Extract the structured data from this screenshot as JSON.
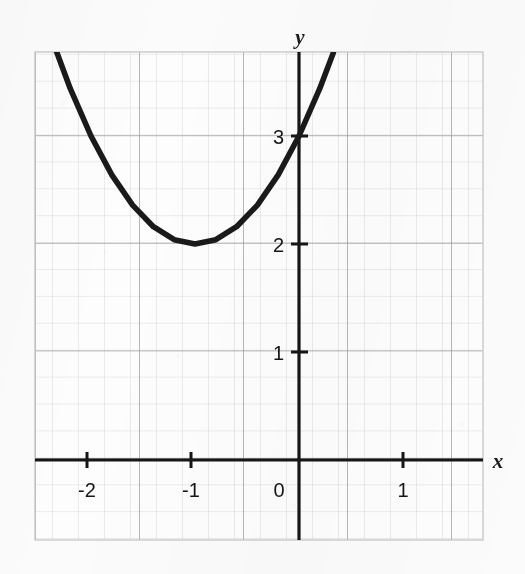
{
  "chart_data": {
    "type": "line",
    "title": "",
    "subtitle": "",
    "xlabel": "x",
    "ylabel": "y",
    "function": "y = (x + 1)^2 + 2",
    "curve_color": "#1a1a1a",
    "xlim": [
      -2.55,
      1.78
    ],
    "ylim": [
      -0.74,
      3.78
    ],
    "grid": true,
    "grid_minor_step": 0.25,
    "grid_major_step": 1,
    "legend": "none",
    "vertex": [
      -1,
      2
    ],
    "y_intercept": [
      0,
      3
    ],
    "x_tick_labels": [
      "-2",
      "-1",
      "0",
      "1"
    ],
    "x_tick_values": [
      -2,
      -1,
      0,
      1
    ],
    "y_tick_labels": [
      "1",
      "2",
      "3"
    ],
    "y_tick_values": [
      1,
      2,
      3
    ],
    "series": [
      {
        "name": "parabola",
        "x": [
          -2.55,
          -2.4,
          -2.2,
          -2.0,
          -1.8,
          -1.6,
          -1.4,
          -1.2,
          -1.0,
          -0.8,
          -0.6,
          -0.4,
          -0.2,
          0.0,
          0.2,
          0.33
        ],
        "y": [
          4.4,
          3.96,
          3.44,
          3.0,
          2.64,
          2.36,
          2.16,
          2.04,
          2.0,
          2.04,
          2.16,
          2.36,
          2.64,
          3.0,
          3.44,
          3.77
        ]
      }
    ]
  },
  "axes": {
    "y_axis_name": "y",
    "x_axis_name": "x",
    "origin_label": "0"
  },
  "colors": {
    "background": "#fbfbfb",
    "grid_minor": "#d8d8d8",
    "grid_major": "#9a9a9a",
    "axis": "#161616",
    "curve": "#1a1a1a",
    "text": "#161616"
  }
}
